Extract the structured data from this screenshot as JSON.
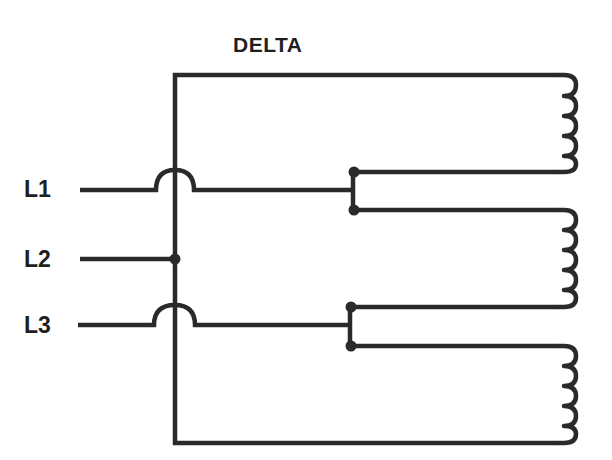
{
  "diagram": {
    "title": "DELTA",
    "type": "three-phase delta motor winding connection",
    "lines": [
      {
        "label": "L1"
      },
      {
        "label": "L2"
      },
      {
        "label": "L3"
      }
    ],
    "windings": [
      {
        "name": "winding-1"
      },
      {
        "name": "winding-2"
      },
      {
        "name": "winding-3"
      }
    ],
    "colors": {
      "line": "#2a2a2a",
      "background": "#ffffff"
    }
  }
}
